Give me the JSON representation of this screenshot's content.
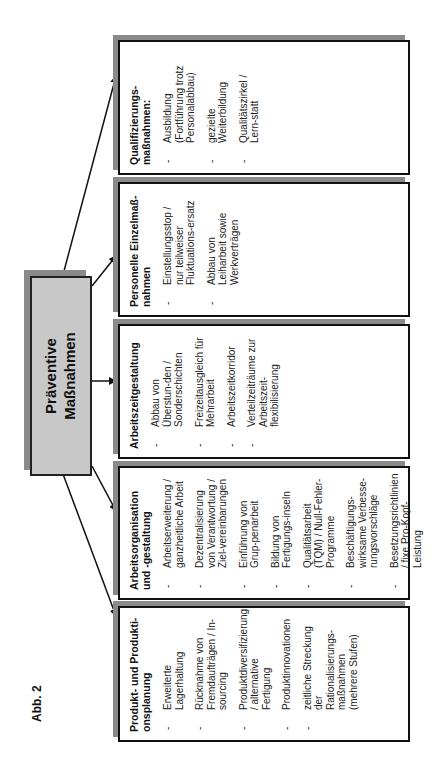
{
  "figure_label": "Abb. 2",
  "center": {
    "line1": "Präventive",
    "line2": "Maßnahmen"
  },
  "columns": [
    {
      "title": "Produkt- und Produkti-onsplanung",
      "items": [
        "Erweiterte Lagerhaltung",
        "Rücknahme von Fremdaufträgen / In-sourcing",
        "Produktdiversifizierung / alternative Fertigung",
        "Produktinnovationen",
        "zeitliche Streckung der Rationalisierungs-maßnahmen (mehrere Stufen)"
      ]
    },
    {
      "title": "Arbeitsorganisation und -gestaltung",
      "items": [
        "Arbeitserweiterung / ganzheitliche Arbeit",
        "Dezentralisierung von Verantwortung / Ziel-vereinbarungen",
        "Einführung von Grup-penarbeit",
        "Bildung von Fertigungs-inseln",
        "Qualitätsarbeit (TQM) / Null-Fehler-Programme",
        "Beschäftigungs-wirksame Verbesse-rungsvorschläge",
        "Besetzungsrichtlinien / fixe Pro-Kopf-Leistung"
      ]
    },
    {
      "title": "Arbeitszeitgestaltung",
      "items": [
        "Abbau von Überstun-den / Sonderschichten",
        "Freizeitausgleich für Mehrarbeit",
        "Arbeitszeitkorridor",
        "Verteilzeiträume zur Arbeitszeit-flexibilisierung"
      ]
    },
    {
      "title": "Personelle Einzelmaß-nahmen",
      "items": [
        "Einstellungsstop / nur teilweiser Fluktuations-ersatz",
        "Abbau von Leiharbeit sowie Werkverträgen"
      ]
    },
    {
      "title": "Qualifizierungs-maßnahmen:",
      "items": [
        "Ausbildung (Fortführung trotz Personalabbau)",
        "gezielte Weiterbildung",
        "Qualitätszirkel / Lern-statt"
      ]
    }
  ]
}
